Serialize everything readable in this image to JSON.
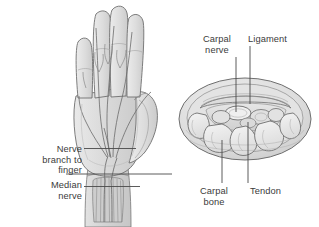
{
  "figure": {
    "background_color": "#ffffff",
    "line_color": "#5a5a5a",
    "text_color": "#3b3b3b",
    "tissue_fill": "#d9d9d9",
    "tissue_fill_light": "#e8e8e8",
    "tissue_fill_dark": "#c4c4c4",
    "bone_fill": "#ededed"
  },
  "labels": {
    "nerve_branch_to_finger": "Nerve\nbranch to\nfinger",
    "median_nerve": "Median\nnerve",
    "carpal_nerve": "Carpal\nnerve",
    "ligament": "Ligament",
    "carpal_bone": "Carpal\nbone",
    "tendon": "Tendon"
  },
  "panels": {
    "left": {
      "name": "palmar-hand-view",
      "description": "Palm view of hand showing median nerve and its branches into the fingers"
    },
    "right": {
      "name": "carpal-tunnel-cross-section",
      "description": "Cross-section through the wrist showing carpal bones, tendons, ligament and carpal nerve"
    }
  }
}
